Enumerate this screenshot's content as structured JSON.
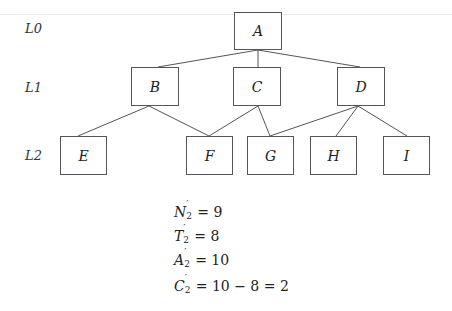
{
  "levels": [
    {
      "label": "L0",
      "x": 25,
      "y": 21
    },
    {
      "label": "L1",
      "x": 25,
      "y": 80
    },
    {
      "label": "L2",
      "x": 25,
      "y": 148
    }
  ],
  "nodes": [
    {
      "id": "A",
      "label": "A",
      "x": 234,
      "y": 12,
      "w": 48,
      "h": 38
    },
    {
      "id": "B",
      "label": "B",
      "x": 131,
      "y": 67,
      "w": 48,
      "h": 39
    },
    {
      "id": "C",
      "label": "C",
      "x": 233,
      "y": 67,
      "w": 48,
      "h": 39
    },
    {
      "id": "D",
      "label": "D",
      "x": 337,
      "y": 67,
      "w": 48,
      "h": 39
    },
    {
      "id": "E",
      "label": "E",
      "x": 60,
      "y": 136,
      "w": 47,
      "h": 39
    },
    {
      "id": "F",
      "label": "F",
      "x": 186,
      "y": 136,
      "w": 47,
      "h": 39
    },
    {
      "id": "G",
      "label": "G",
      "x": 247,
      "y": 136,
      "w": 47,
      "h": 39
    },
    {
      "id": "H",
      "label": "H",
      "x": 310,
      "y": 136,
      "w": 47,
      "h": 39
    },
    {
      "id": "I",
      "label": "I",
      "x": 383,
      "y": 136,
      "w": 47,
      "h": 39
    }
  ],
  "edges": [
    {
      "from": "A",
      "to": "B",
      "x1": 258,
      "y1": 50,
      "x2": 158,
      "y2": 67
    },
    {
      "from": "A",
      "to": "C",
      "x1": 258,
      "y1": 50,
      "x2": 258,
      "y2": 67
    },
    {
      "from": "A",
      "to": "D",
      "x1": 258,
      "y1": 50,
      "x2": 360,
      "y2": 67
    },
    {
      "from": "B",
      "to": "E",
      "x1": 149,
      "y1": 106,
      "x2": 78,
      "y2": 136
    },
    {
      "from": "B",
      "to": "F",
      "x1": 149,
      "y1": 106,
      "x2": 209,
      "y2": 136
    },
    {
      "from": "C",
      "to": "F",
      "x1": 258,
      "y1": 106,
      "x2": 209,
      "y2": 136
    },
    {
      "from": "C",
      "to": "G",
      "x1": 258,
      "y1": 106,
      "x2": 270,
      "y2": 136
    },
    {
      "from": "D",
      "to": "G",
      "x1": 358,
      "y1": 106,
      "x2": 270,
      "y2": 136
    },
    {
      "from": "D",
      "to": "H",
      "x1": 358,
      "y1": 106,
      "x2": 336,
      "y2": 136
    },
    {
      "from": "D",
      "to": "I",
      "x1": 358,
      "y1": 106,
      "x2": 407,
      "y2": 136
    }
  ],
  "formulas": [
    {
      "symbol": "N",
      "prime": "′",
      "sub": "2",
      "rhs": "= 9",
      "y": 204
    },
    {
      "symbol": "T",
      "prime": "′",
      "sub": "2",
      "rhs": "= 8",
      "y": 228
    },
    {
      "symbol": "A",
      "prime": "′",
      "sub": "2",
      "rhs": "= 10",
      "y": 252
    },
    {
      "symbol": "C",
      "prime": "′",
      "sub": "2",
      "rhs": "= 10 − 8 = 2",
      "y": 278
    }
  ],
  "colors": {
    "stroke": "#555555",
    "text": "#222222",
    "background": "#ffffff"
  }
}
